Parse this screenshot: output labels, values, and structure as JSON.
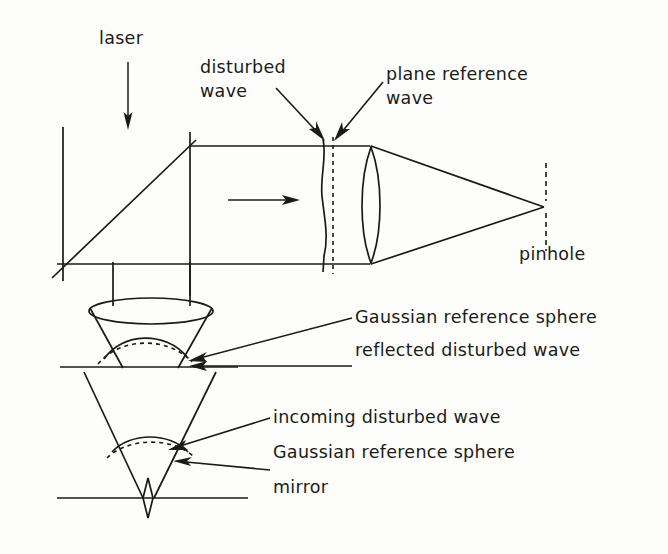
{
  "figure": {
    "ink_color": "#1a1a18",
    "background_color": "#fdfdfb"
  },
  "labels": {
    "laser": "laser",
    "disturbed_wave_line1": "disturbed",
    "disturbed_wave_line2": "wave",
    "plane_reference_line1": "plane reference",
    "plane_reference_line2": "wave",
    "pinhole": "pinhole",
    "gaussian_reference_sphere_upper": "Gaussian reference sphere",
    "reflected_disturbed_wave": "reflected disturbed wave",
    "incoming_disturbed_wave": "incoming disturbed wave",
    "gaussian_reference_sphere_lower": "Gaussian reference sphere",
    "mirror": "mirror"
  },
  "components": [
    {
      "name": "laser-beam-arrow",
      "description": "downward arrow from laser source"
    },
    {
      "name": "beam-splitter",
      "description": "diagonal 45 degree line"
    },
    {
      "name": "disturbed-wavefront",
      "description": "wavy vertical solid line"
    },
    {
      "name": "plane-reference-wavefront",
      "description": "straight vertical dashed line"
    },
    {
      "name": "collimated-beam-direction-arrow",
      "description": "rightward arrow inside beam"
    },
    {
      "name": "focusing-lens",
      "description": "biconvex lens"
    },
    {
      "name": "pinhole",
      "description": "vertical dashed aperture at focus"
    },
    {
      "name": "objective-lens-ellipse",
      "description": "ellipse lens in lower path"
    },
    {
      "name": "reflected-wavefront-upper",
      "description": "curved solid arc"
    },
    {
      "name": "gaussian-sphere-upper",
      "description": "curved dashed arc"
    },
    {
      "name": "incoming-wavefront-lower",
      "description": "curved solid arc"
    },
    {
      "name": "gaussian-sphere-lower",
      "description": "curved dashed arc"
    },
    {
      "name": "mirror-surface",
      "description": "horizontal line at bottom"
    }
  ]
}
